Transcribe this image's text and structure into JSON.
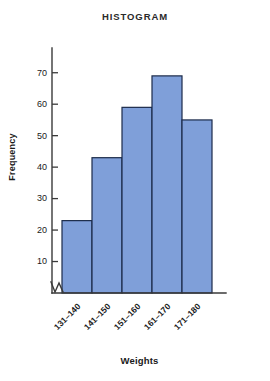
{
  "chart_data": {
    "type": "bar",
    "title": "HISTOGRAM",
    "xlabel": "Weights",
    "ylabel": "Frequency",
    "categories": [
      "131–140",
      "141–150",
      "151–160",
      "161–170",
      "171–180"
    ],
    "values": [
      23,
      43,
      59,
      69,
      55
    ],
    "ylim": [
      0,
      75
    ],
    "yticks": [
      10,
      20,
      30,
      40,
      50,
      60,
      70
    ],
    "ytick_labels": [
      "10",
      "20",
      "30",
      "40",
      "50",
      "60",
      "70"
    ],
    "grid": false,
    "legend": null,
    "axis_break": true,
    "bar_fill_color": "#7f9fd9",
    "bar_edge_color": "#1c2b4a",
    "axis_color": "#3a3a3a",
    "background_color": "#ffffff"
  }
}
